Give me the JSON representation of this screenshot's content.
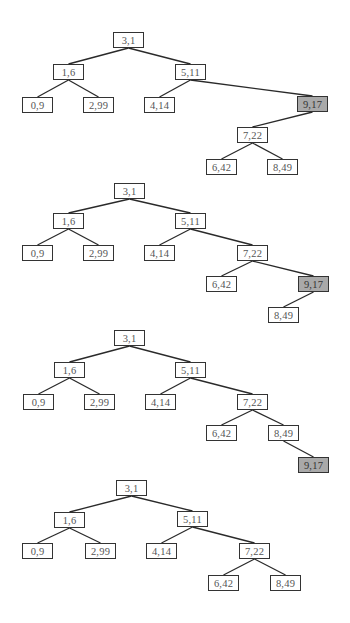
{
  "diagram": {
    "type": "binary-search-tree-sequence",
    "node_size": {
      "w": 31,
      "h": 16
    },
    "colors": {
      "highlight": "#a9a9a9",
      "border": "#333333",
      "edge": "#2a2a2a"
    },
    "trees": [
      {
        "name": "tree-1",
        "nodes": [
          {
            "id": "n31",
            "label": "3,1",
            "x": 113,
            "y": 32
          },
          {
            "id": "n16",
            "label": "1,6",
            "x": 53,
            "y": 64
          },
          {
            "id": "n511",
            "label": "5,11",
            "x": 175,
            "y": 64
          },
          {
            "id": "n09",
            "label": "0,9",
            "x": 22,
            "y": 97
          },
          {
            "id": "n299",
            "label": "2,99",
            "x": 83,
            "y": 97
          },
          {
            "id": "n414",
            "label": "4,14",
            "x": 144,
            "y": 97
          },
          {
            "id": "n917",
            "label": "9,17",
            "x": 297,
            "y": 96,
            "highlight": true
          },
          {
            "id": "n722",
            "label": "7,22",
            "x": 237,
            "y": 127
          },
          {
            "id": "n642",
            "label": "6,42",
            "x": 206,
            "y": 159
          },
          {
            "id": "n849",
            "label": "8,49",
            "x": 267,
            "y": 159
          }
        ],
        "edges": [
          [
            "n31",
            "n16"
          ],
          [
            "n31",
            "n511"
          ],
          [
            "n16",
            "n09"
          ],
          [
            "n16",
            "n299"
          ],
          [
            "n511",
            "n414"
          ],
          [
            "n511",
            "n917"
          ],
          [
            "n917",
            "n722"
          ],
          [
            "n722",
            "n642"
          ],
          [
            "n722",
            "n849"
          ]
        ]
      },
      {
        "name": "tree-2",
        "nodes": [
          {
            "id": "n31",
            "label": "3,1",
            "x": 114,
            "y": 183
          },
          {
            "id": "n16",
            "label": "1,6",
            "x": 53,
            "y": 213
          },
          {
            "id": "n511",
            "label": "5,11",
            "x": 175,
            "y": 213
          },
          {
            "id": "n09",
            "label": "0,9",
            "x": 22,
            "y": 245
          },
          {
            "id": "n299",
            "label": "2,99",
            "x": 83,
            "y": 245
          },
          {
            "id": "n414",
            "label": "4,14",
            "x": 144,
            "y": 245
          },
          {
            "id": "n722",
            "label": "7,22",
            "x": 237,
            "y": 245
          },
          {
            "id": "n642",
            "label": "6,42",
            "x": 206,
            "y": 276
          },
          {
            "id": "n917",
            "label": "9,17",
            "x": 298,
            "y": 276,
            "highlight": true
          },
          {
            "id": "n849",
            "label": "8,49",
            "x": 268,
            "y": 307
          }
        ],
        "edges": [
          [
            "n31",
            "n16"
          ],
          [
            "n31",
            "n511"
          ],
          [
            "n16",
            "n09"
          ],
          [
            "n16",
            "n299"
          ],
          [
            "n511",
            "n414"
          ],
          [
            "n511",
            "n722"
          ],
          [
            "n722",
            "n642"
          ],
          [
            "n722",
            "n917"
          ],
          [
            "n917",
            "n849"
          ]
        ]
      },
      {
        "name": "tree-3",
        "nodes": [
          {
            "id": "n31",
            "label": "3,1",
            "x": 114,
            "y": 330
          },
          {
            "id": "n16",
            "label": "1,6",
            "x": 54,
            "y": 362
          },
          {
            "id": "n511",
            "label": "5,11",
            "x": 175,
            "y": 362
          },
          {
            "id": "n09",
            "label": "0,9",
            "x": 23,
            "y": 394
          },
          {
            "id": "n299",
            "label": "2,99",
            "x": 84,
            "y": 394
          },
          {
            "id": "n414",
            "label": "4,14",
            "x": 145,
            "y": 394
          },
          {
            "id": "n722",
            "label": "7,22",
            "x": 237,
            "y": 394
          },
          {
            "id": "n642",
            "label": "6,42",
            "x": 206,
            "y": 425
          },
          {
            "id": "n849",
            "label": "8,49",
            "x": 268,
            "y": 425
          },
          {
            "id": "n917",
            "label": "9,17",
            "x": 298,
            "y": 457,
            "highlight": true
          }
        ],
        "edges": [
          [
            "n31",
            "n16"
          ],
          [
            "n31",
            "n511"
          ],
          [
            "n16",
            "n09"
          ],
          [
            "n16",
            "n299"
          ],
          [
            "n511",
            "n414"
          ],
          [
            "n511",
            "n722"
          ],
          [
            "n722",
            "n642"
          ],
          [
            "n722",
            "n849"
          ],
          [
            "n849",
            "n917"
          ]
        ]
      },
      {
        "name": "tree-4",
        "nodes": [
          {
            "id": "n31",
            "label": "3,1",
            "x": 116,
            "y": 480
          },
          {
            "id": "n16",
            "label": "1,6",
            "x": 54,
            "y": 512
          },
          {
            "id": "n511",
            "label": "5,11",
            "x": 177,
            "y": 511
          },
          {
            "id": "n09",
            "label": "0,9",
            "x": 22,
            "y": 543
          },
          {
            "id": "n299",
            "label": "2,99",
            "x": 85,
            "y": 543
          },
          {
            "id": "n414",
            "label": "4,14",
            "x": 146,
            "y": 543
          },
          {
            "id": "n722",
            "label": "7,22",
            "x": 239,
            "y": 543
          },
          {
            "id": "n642",
            "label": "6,42",
            "x": 208,
            "y": 575
          },
          {
            "id": "n849",
            "label": "8,49",
            "x": 270,
            "y": 575
          }
        ],
        "edges": [
          [
            "n31",
            "n16"
          ],
          [
            "n31",
            "n511"
          ],
          [
            "n16",
            "n09"
          ],
          [
            "n16",
            "n299"
          ],
          [
            "n511",
            "n414"
          ],
          [
            "n511",
            "n722"
          ],
          [
            "n722",
            "n642"
          ],
          [
            "n722",
            "n849"
          ]
        ]
      }
    ]
  }
}
